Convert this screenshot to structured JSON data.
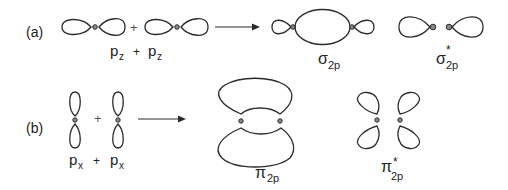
{
  "diagram": {
    "part_a": {
      "label": "(a)",
      "reactants": {
        "left": "p",
        "left_sub": "z",
        "operator": "+",
        "right": "p",
        "right_sub": "z"
      },
      "between_plus": "+",
      "products": [
        {
          "symbol": "σ",
          "sub": "2p",
          "sup": "",
          "type": "bonding"
        },
        {
          "symbol": "σ",
          "sub": "2p",
          "sup": "*",
          "type": "antibonding"
        }
      ]
    },
    "part_b": {
      "label": "(b)",
      "reactants": {
        "left": "p",
        "left_sub": "x",
        "operator": "+",
        "right": "p",
        "right_sub": "x"
      },
      "between_plus": "+",
      "products": [
        {
          "symbol": "π",
          "sub": "2p",
          "sup": "",
          "type": "bonding"
        },
        {
          "symbol": "π",
          "sub": "2p",
          "sup": "*",
          "type": "antibonding"
        }
      ]
    },
    "colors": {
      "stroke": "#2a2a2a",
      "node_fill": "#8a8a8a",
      "background": "#ffffff"
    }
  }
}
